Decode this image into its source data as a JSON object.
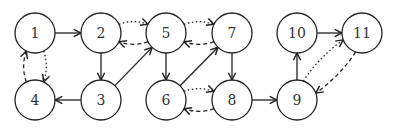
{
  "diagram": {
    "type": "directed-graph",
    "nodes": [
      {
        "id": "1",
        "label": "1",
        "x": 35,
        "y": 33
      },
      {
        "id": "2",
        "label": "2",
        "x": 101,
        "y": 33
      },
      {
        "id": "3",
        "label": "3",
        "x": 101,
        "y": 100
      },
      {
        "id": "4",
        "label": "4",
        "x": 35,
        "y": 100
      },
      {
        "id": "5",
        "label": "5",
        "x": 166,
        "y": 33
      },
      {
        "id": "6",
        "label": "6",
        "x": 166,
        "y": 100
      },
      {
        "id": "7",
        "label": "7",
        "x": 232,
        "y": 33
      },
      {
        "id": "8",
        "label": "8",
        "x": 232,
        "y": 100
      },
      {
        "id": "9",
        "label": "9",
        "x": 297,
        "y": 100
      },
      {
        "id": "10",
        "label": "10",
        "x": 297,
        "y": 33
      },
      {
        "id": "11",
        "label": "11",
        "x": 362,
        "y": 33
      }
    ],
    "edges": [
      {
        "from": "1",
        "to": "2",
        "style": "solid"
      },
      {
        "from": "2",
        "to": "3",
        "style": "solid"
      },
      {
        "from": "3",
        "to": "4",
        "style": "solid"
      },
      {
        "from": "3",
        "to": "5",
        "style": "solid"
      },
      {
        "from": "5",
        "to": "6",
        "style": "solid"
      },
      {
        "from": "6",
        "to": "7",
        "style": "solid"
      },
      {
        "from": "7",
        "to": "8",
        "style": "solid"
      },
      {
        "from": "8",
        "to": "9",
        "style": "solid"
      },
      {
        "from": "9",
        "to": "10",
        "style": "solid"
      },
      {
        "from": "10",
        "to": "11",
        "style": "solid"
      },
      {
        "from": "1",
        "to": "4",
        "style": "dotted"
      },
      {
        "from": "4",
        "to": "1",
        "style": "dashed"
      },
      {
        "from": "5",
        "to": "2",
        "style": "dashed"
      },
      {
        "from": "2",
        "to": "5",
        "style": "dotted"
      },
      {
        "from": "7",
        "to": "5",
        "style": "dashed"
      },
      {
        "from": "5",
        "to": "7",
        "style": "dotted"
      },
      {
        "from": "8",
        "to": "6",
        "style": "dashed"
      },
      {
        "from": "6",
        "to": "8",
        "style": "dotted"
      },
      {
        "from": "11",
        "to": "9",
        "style": "dashed"
      },
      {
        "from": "9",
        "to": "11",
        "style": "dotted"
      }
    ]
  }
}
